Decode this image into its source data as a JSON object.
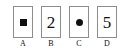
{
  "diagram": {
    "type": "card-row",
    "background_color": "#ffffff",
    "border_color": "#8d8d8d",
    "ink_color": "#111111",
    "cards": [
      {
        "label": "A",
        "content_kind": "shape",
        "shape": "filled-square",
        "text": ""
      },
      {
        "label": "B",
        "content_kind": "text",
        "shape": "",
        "text": "2"
      },
      {
        "label": "C",
        "content_kind": "shape",
        "shape": "filled-circle",
        "text": ""
      },
      {
        "label": "D",
        "content_kind": "text",
        "shape": "",
        "text": "5"
      }
    ]
  }
}
